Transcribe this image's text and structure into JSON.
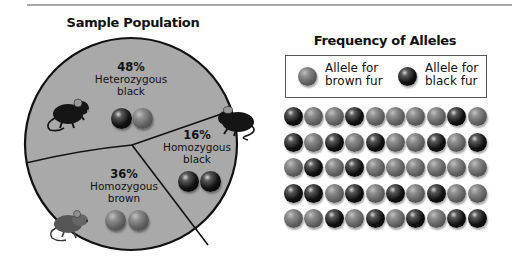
{
  "header": {
    "divider": true
  },
  "sample_population": {
    "title": "Sample Population",
    "fill_color": "#a9a9a9",
    "slices": [
      {
        "id": "heterozygous-black",
        "percent_label": "48%",
        "line1": "Heterozygous",
        "line2": "black",
        "alleles": [
          "black",
          "brown"
        ],
        "mouse": "black-mouse"
      },
      {
        "id": "homozygous-black",
        "percent_label": "16%",
        "line1": "Homozygous",
        "line2": "black",
        "alleles": [
          "black",
          "black"
        ],
        "mouse": "black-mouse"
      },
      {
        "id": "homozygous-brown",
        "percent_label": "36%",
        "line1": "Homozygous",
        "line2": "brown",
        "alleles": [
          "brown",
          "brown"
        ],
        "mouse": "brown-mouse"
      }
    ]
  },
  "frequency_of_alleles": {
    "title": "Frequency of Alleles",
    "legend": [
      {
        "type": "brown",
        "line1": "Allele for",
        "line2": "brown fur"
      },
      {
        "type": "black",
        "line1": "Allele for",
        "line2": "black fur"
      }
    ],
    "grid": [
      [
        "black",
        "brown",
        "brown",
        "black",
        "brown",
        "brown",
        "brown",
        "brown",
        "black",
        "brown"
      ],
      [
        "black",
        "brown",
        "black",
        "brown",
        "black",
        "brown",
        "brown",
        "black",
        "brown",
        "black"
      ],
      [
        "brown",
        "black",
        "brown",
        "black",
        "brown",
        "brown",
        "brown",
        "brown",
        "brown",
        "brown"
      ],
      [
        "black",
        "black",
        "brown",
        "black",
        "brown",
        "black",
        "brown",
        "black",
        "brown",
        "brown"
      ],
      [
        "brown",
        "brown",
        "black",
        "brown",
        "black",
        "brown",
        "black",
        "brown",
        "black",
        "black"
      ]
    ]
  },
  "chart_data": {
    "type": "pie",
    "title": "Sample Population",
    "categories": [
      "Heterozygous black",
      "Homozygous black",
      "Homozygous brown"
    ],
    "values": [
      48,
      16,
      36
    ],
    "unit": "%"
  }
}
